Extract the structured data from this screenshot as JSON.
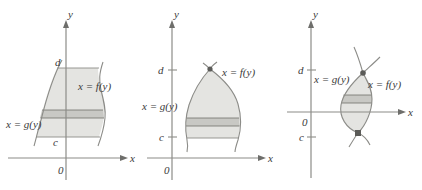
{
  "figure": {
    "kind": "calculus-diagram",
    "colors": {
      "region_fill": "#e4e4e1",
      "strip_fill": "#c8c8c4",
      "curve_stroke": "#8c8c88",
      "axis_stroke": "#8c8c88",
      "text": "#3a3a3a",
      "point_fill": "#5b5b58",
      "background": "#ffffff"
    }
  },
  "panels": [
    {
      "id": "panel-left",
      "axes": {
        "y_axis_label": "y",
        "x_axis_label": "x",
        "origin_label": "0"
      },
      "bounds": {
        "upper_label": "d",
        "lower_label": "c"
      },
      "curves": {
        "right_label": "x = f(y)",
        "left_label": "x = g(y)"
      }
    },
    {
      "id": "panel-middle",
      "axes": {
        "y_axis_label": "y",
        "x_axis_label": "x",
        "origin_label": "0"
      },
      "bounds": {
        "upper_label": "d",
        "lower_label": "c"
      },
      "curves": {
        "right_label": "x = f(y)",
        "left_label": "x = g(y)"
      }
    },
    {
      "id": "panel-right",
      "axes": {
        "y_axis_label": "y",
        "x_axis_label": "x",
        "origin_label": "0"
      },
      "bounds": {
        "upper_label": "d",
        "lower_label": "c"
      },
      "curves": {
        "right_label": "x = f(y)",
        "left_label": "x = g(y)"
      }
    }
  ]
}
